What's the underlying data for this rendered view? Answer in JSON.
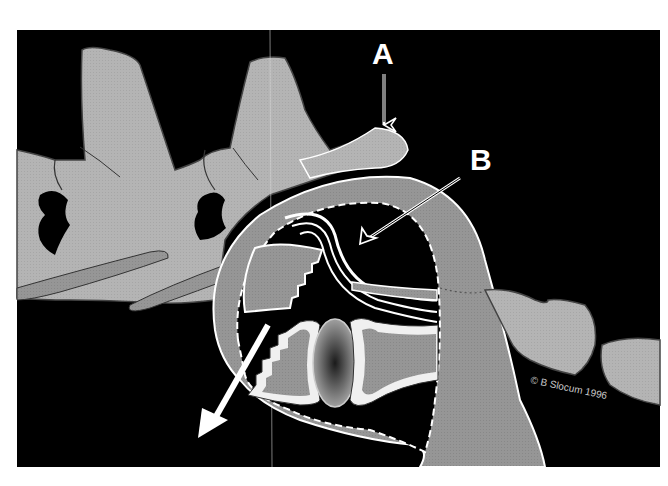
{
  "figure": {
    "labels": {
      "a": "A",
      "b": "B"
    },
    "credit": "© B Slocum 1996"
  },
  "colors": {
    "page_background": "#ffffff",
    "panel_background": "#000000",
    "bone_light": "#b8b8b8",
    "capsule_gray": "#9a9a9a",
    "outline_white": "#ffffff",
    "cartilage_white": "#f0f0f0",
    "outline_dark": "#3a3a3a"
  },
  "annotations": [
    {
      "id": "A",
      "arrow": "open-head vertical arrow pointing down onto bony process"
    },
    {
      "id": "B",
      "arrow": "open-head diagonal arrow pointing into joint cavity"
    },
    {
      "id": "motion",
      "arrow": "solid white arrow pointing down-left"
    }
  ]
}
